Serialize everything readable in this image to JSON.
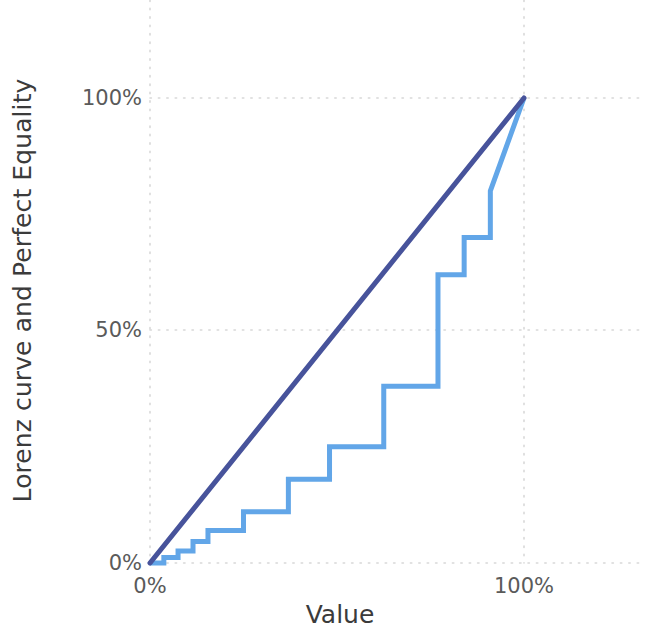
{
  "figure": {
    "background_color": "#ffffff",
    "width": 645,
    "height": 635
  },
  "axes": {
    "x_title": "Value",
    "y_title": "Lorenz curve and Perfect Equality",
    "x_ticks": [
      {
        "label": "0%",
        "value": 0
      },
      {
        "label": "100%",
        "value": 100
      }
    ],
    "y_ticks": [
      {
        "label": "0%",
        "value": 0
      },
      {
        "label": "50%",
        "value": 50
      },
      {
        "label": "100%",
        "value": 100
      }
    ],
    "tick_color": "#5a5a5a",
    "title_color": "#3b3b3b",
    "grid_color": "#d8d8d8"
  },
  "chart_data": {
    "type": "line",
    "title": "",
    "subtitle": "",
    "xlabel": "Value",
    "ylabel": "Lorenz curve and Perfect Equality",
    "xlim": [
      0,
      100
    ],
    "ylim": [
      0,
      100
    ],
    "xtick_labels": [
      "0%",
      "100%"
    ],
    "ytick_labels": [
      "0%",
      "50%",
      "100%"
    ],
    "grid": true,
    "grid_style": "dotted",
    "legend": "none",
    "series": [
      {
        "name": "Perfect Equality",
        "type": "line",
        "color": "#47539b",
        "linewidth": 5,
        "drawstyle": "straight",
        "x": [
          0,
          100
        ],
        "y": [
          0,
          100
        ]
      },
      {
        "name": "Lorenz curve",
        "type": "step",
        "color": "#62a6e8",
        "linewidth": 5,
        "drawstyle": "steps-post",
        "x": [
          0,
          3.7,
          3.7,
          7.5,
          7.5,
          11.5,
          11.5,
          15.5,
          15.5,
          25.0,
          25.0,
          37.0,
          37.0,
          48.0,
          48.0,
          62.5,
          62.5,
          77.0,
          77.0,
          84.0,
          84.0,
          91.0,
          91.0,
          100.0
        ],
        "y": [
          0,
          0.0,
          1.2,
          1.2,
          2.6,
          2.6,
          4.6,
          4.6,
          7.0,
          7.0,
          11.0,
          11.0,
          18.0,
          18.0,
          25.0,
          25.0,
          38.0,
          38.0,
          62.0,
          62.0,
          70.0,
          70.0,
          80.0,
          100.0
        ]
      }
    ]
  }
}
